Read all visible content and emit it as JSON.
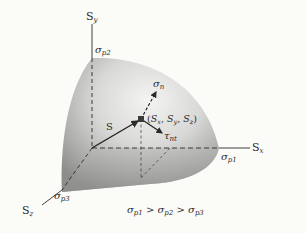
{
  "diagram": {
    "type": "principal-stress-ellipsoid",
    "axes": {
      "x": {
        "label_main": "S",
        "label_sub": "x",
        "intercept_main": "σ",
        "intercept_sub": "p1"
      },
      "y": {
        "label_main": "S",
        "label_sub": "y",
        "intercept_main": "σ",
        "intercept_sub": "p2"
      },
      "z": {
        "label_main": "S",
        "label_sub": "z",
        "intercept_main": "σ",
        "intercept_sub": "p3"
      }
    },
    "vectors": {
      "resultant": {
        "label": "S"
      },
      "normal": {
        "label_main": "σ",
        "label_sub": "n"
      },
      "shear": {
        "label_main": "τ",
        "label_sub": "nt"
      }
    },
    "point_label": "(S",
    "point_coords": [
      "x",
      "y",
      "z"
    ],
    "inequality": {
      "terms": [
        "p1",
        "p2",
        "p3"
      ],
      "symbol": "σ",
      "operator": ">"
    },
    "colors": {
      "background": "#fbfbf8",
      "ink": "#2a2a2a",
      "surface_light": "#f2f2f0",
      "surface_dark": "#8a8a88"
    }
  }
}
